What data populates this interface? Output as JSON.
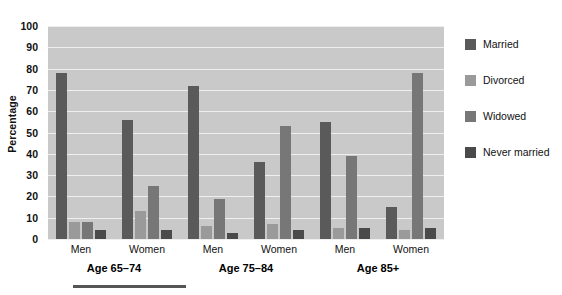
{
  "chart_data": {
    "type": "bar",
    "title": "",
    "subtitle": "",
    "xlabel": "",
    "ylabel": "Percentage",
    "ylim": [
      0,
      100
    ],
    "ytick_step": 10,
    "yticks": [
      100,
      90,
      80,
      70,
      60,
      50,
      40,
      30,
      20,
      10,
      0
    ],
    "grid": true,
    "grid_color": "#efefef",
    "plot_background": "#c9c9c9",
    "legend_position": "right",
    "categories": [
      "Men",
      "Women",
      "Men",
      "Women",
      "Men",
      "Women"
    ],
    "group_labels": [
      "Age 65–74",
      "Age 75–84",
      "Age 85+"
    ],
    "series": [
      {
        "name": "Married",
        "color": "#5a5a5a",
        "values": [
          78,
          56,
          72,
          36,
          55,
          15
        ]
      },
      {
        "name": "Divorced",
        "color": "#9a9a9a",
        "values": [
          8,
          13,
          6,
          7,
          5,
          4
        ]
      },
      {
        "name": "Widowed",
        "color": "#777777",
        "values": [
          8,
          25,
          19,
          53,
          39,
          78
        ]
      },
      {
        "name": "Never married",
        "color": "#4a4a4a",
        "values": [
          4,
          4,
          3,
          4,
          5,
          5
        ]
      }
    ]
  },
  "legend": {
    "items": [
      {
        "label": "Married"
      },
      {
        "label": "Divorced"
      },
      {
        "label": "Widowed"
      },
      {
        "label": "Never married"
      }
    ]
  },
  "axis": {
    "y_title": "Percentage"
  }
}
